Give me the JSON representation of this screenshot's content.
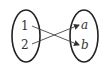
{
  "diagram": {
    "type": "mapping",
    "domain_set": {
      "elements": [
        "1",
        "2"
      ]
    },
    "codomain_set": {
      "elements": [
        "a",
        "b"
      ]
    },
    "mappings": [
      {
        "from": "1",
        "to": "b"
      },
      {
        "from": "2",
        "to": "a"
      }
    ],
    "colors": {
      "stroke": "#222222",
      "text": "#333333",
      "background": "#ffffff"
    }
  }
}
